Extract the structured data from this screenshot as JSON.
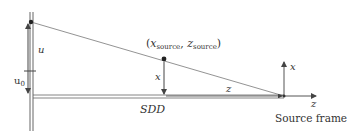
{
  "diagram": {
    "labels": {
      "u": "u",
      "u0_base": "u",
      "u0_sub": "0",
      "x_point": "x",
      "z_dist": "z",
      "sdd": "SDD",
      "point_open": "(",
      "point_x": "x",
      "point_x_sub": "source",
      "point_sep": ", ",
      "point_z": "z",
      "point_z_sub": "source",
      "point_close": ")",
      "frame_x": "x",
      "frame_z": "z",
      "frame_caption": "Source frame"
    },
    "colors": {
      "line": "#555555",
      "detector": "#666666",
      "text": "#333333"
    }
  }
}
